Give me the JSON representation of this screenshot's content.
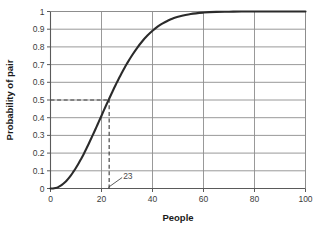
{
  "chart_data": {
    "type": "line",
    "title": "",
    "xlabel": "People",
    "ylabel": "Probability of pair",
    "xlim": [
      0,
      100
    ],
    "ylim": [
      0,
      1
    ],
    "grid": true,
    "legend": "none",
    "x_ticks": [
      "0",
      "20",
      "40",
      "60",
      "80",
      "100"
    ],
    "x_tick_values": [
      0,
      20,
      40,
      60,
      80,
      100
    ],
    "y_ticks": [
      "0",
      "0.1",
      "0.2",
      "0.3",
      "0.4",
      "0.5",
      "0.6",
      "0.7",
      "0.8",
      "0.9",
      "1"
    ],
    "y_tick_values": [
      0,
      0.1,
      0.2,
      0.3,
      0.4,
      0.5,
      0.6,
      0.7,
      0.8,
      0.9,
      1
    ],
    "series": [
      {
        "name": "Probability of shared birthday",
        "color": "#2b2b2b",
        "x": [
          0,
          1,
          2,
          3,
          4,
          5,
          6,
          7,
          8,
          9,
          10,
          11,
          12,
          13,
          14,
          15,
          16,
          17,
          18,
          19,
          20,
          21,
          22,
          23,
          24,
          25,
          26,
          27,
          28,
          29,
          30,
          32,
          34,
          36,
          38,
          40,
          42,
          44,
          46,
          48,
          50,
          55,
          60,
          65,
          70,
          75,
          80,
          85,
          90,
          95,
          100
        ],
        "values": [
          0,
          0,
          0.003,
          0.008,
          0.016,
          0.027,
          0.04,
          0.056,
          0.074,
          0.095,
          0.117,
          0.141,
          0.167,
          0.194,
          0.223,
          0.253,
          0.284,
          0.315,
          0.347,
          0.379,
          0.411,
          0.444,
          0.476,
          0.507,
          0.538,
          0.569,
          0.598,
          0.627,
          0.654,
          0.681,
          0.706,
          0.753,
          0.795,
          0.832,
          0.864,
          0.891,
          0.914,
          0.933,
          0.948,
          0.961,
          0.97,
          0.986,
          0.994,
          0.998,
          0.999,
          1,
          1,
          1,
          1,
          1,
          1
        ]
      }
    ],
    "annotations": [
      {
        "label": "23",
        "x": 23,
        "y": 0.5,
        "note": "dashed guide lines mark p=0.5 at 23 people"
      }
    ],
    "guide_lines": [
      {
        "orientation": "horizontal",
        "value": 0.5,
        "from_x": 0,
        "to_x": 23,
        "style": "dashed"
      },
      {
        "orientation": "vertical",
        "value": 23,
        "from_y": 0,
        "to_y": 0.5,
        "style": "dashed"
      }
    ],
    "colors": {
      "curve": "#2b2b2b",
      "grid": "#8d8d8d",
      "axis": "#5a5a5a",
      "guide": "#3a3a3a",
      "background": "#ffffff"
    }
  }
}
